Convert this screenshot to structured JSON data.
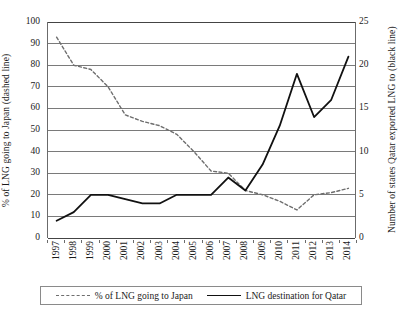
{
  "chart_data": {
    "type": "line",
    "title": "",
    "xlabel": "",
    "categories": [
      "1997",
      "1998",
      "1999",
      "2000",
      "2001",
      "2002",
      "2003",
      "2004",
      "2005",
      "2006",
      "2007",
      "2008",
      "2009",
      "2010",
      "2011",
      "2012",
      "2013",
      "2014"
    ],
    "grid": true,
    "legend_position": "bottom",
    "axes": {
      "left": {
        "label": "% of LNG going to Japan (dashed line)",
        "ticks": [
          0,
          10,
          20,
          30,
          40,
          50,
          60,
          70,
          80,
          90,
          100
        ],
        "ylim": [
          0,
          100
        ]
      },
      "right": {
        "label": "Number of states Qatar exported LNG to (black line)",
        "ticks": [
          0,
          5,
          10,
          15,
          20,
          25
        ],
        "ylim": [
          0,
          25
        ]
      }
    },
    "series": [
      {
        "name": "% of LNG going to Japan",
        "axis": "left",
        "style": "dashed",
        "color": "#6e6e6e",
        "values": [
          93,
          80,
          78,
          70,
          57,
          54,
          52,
          48,
          40,
          31,
          30,
          22,
          20,
          17,
          13,
          20,
          21,
          23
        ]
      },
      {
        "name": "LNG destination for Qatar",
        "axis": "right",
        "style": "solid",
        "color": "#111111",
        "values": [
          2,
          3,
          5,
          5,
          4.5,
          4,
          4,
          5,
          5,
          5,
          7,
          5.5,
          8.5,
          13,
          19,
          14,
          16,
          21
        ]
      }
    ]
  },
  "legend": {
    "entries": [
      {
        "label": "% of LNG going to Japan",
        "style": "dashed"
      },
      {
        "label": "LNG destination for Qatar",
        "style": "solid"
      }
    ]
  }
}
